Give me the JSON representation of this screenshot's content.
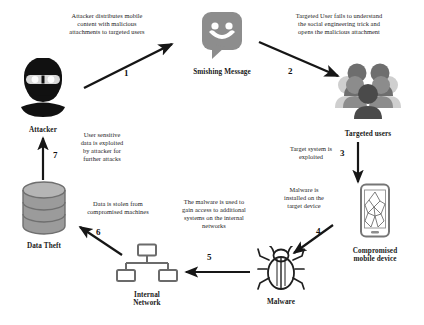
{
  "diagram": {
    "background_color": "#ffffff",
    "text_color": "#1c1c1c",
    "accent_gray": "#8a8a8a",
    "dark_gray": "#5f5f5f",
    "light_gray": "#c9c9c9",
    "arrow_color": "#1a1a1a"
  },
  "nodes": [
    {
      "id": "attacker",
      "label": "Attacker",
      "icon": "hooded-attacker-icon",
      "color": "#111111"
    },
    {
      "id": "smishing_message",
      "label": "Smishing Message",
      "icon": "chat-bubble-smiley-icon",
      "color": "#8a8a8a"
    },
    {
      "id": "targeted_users",
      "label": "Targeted users",
      "icon": "user-group-icon",
      "color": "#7d7d7d"
    },
    {
      "id": "compromised_device",
      "label": "Compromised\nmobile device",
      "label_line1": "Compromised",
      "label_line2": "mobile device",
      "icon": "cracked-smartphone-icon",
      "color": "#7a7a7a"
    },
    {
      "id": "malware",
      "label": "Malware",
      "icon": "bug-icon",
      "color": "#1f1f1f"
    },
    {
      "id": "internal_network",
      "label": "Internal\nNetwork",
      "label_line1": "Internal",
      "label_line2": "Network",
      "icon": "network-tree-icon",
      "color": "#6e6e6e"
    },
    {
      "id": "data_theft",
      "label": "Data Theft",
      "icon": "database-cylinder-icon",
      "color": "#8c8c8c"
    }
  ],
  "steps": [
    {
      "number": "1",
      "caption": "Attacker distributes mobile content with malicious attachments to targeted users",
      "caption_lines": [
        "Attacker distributes mobile",
        "content with malicious",
        "attachments to targeted users"
      ],
      "from": "attacker",
      "to": "smishing_message"
    },
    {
      "number": "2",
      "caption": "Targeted User fails to understand the social engineering trick and opens the malicious attachment",
      "caption_lines": [
        "Targeted User fails to understand",
        "the social engineering trick and",
        "opens the malicious attachment"
      ],
      "from": "smishing_message",
      "to": "targeted_users"
    },
    {
      "number": "3",
      "caption": "Target system is exploited",
      "caption_lines": [
        "Target system is",
        "exploited"
      ],
      "from": "targeted_users",
      "to": "compromised_device"
    },
    {
      "number": "4",
      "caption": "Malware is installed on the target device",
      "caption_lines": [
        "Malware is",
        "installed on the",
        "target device"
      ],
      "from": "compromised_device",
      "to": "malware"
    },
    {
      "number": "5",
      "caption": "The malware is used to gain access to additional systems on the internal networks",
      "caption_lines": [
        "The malware is used to",
        "gain access to additional",
        "systems on the internal",
        "networks"
      ],
      "from": "malware",
      "to": "internal_network"
    },
    {
      "number": "6",
      "caption": "Data is stolen from compromised machines",
      "caption_lines": [
        "Data is stolen from",
        "compromised machines"
      ],
      "from": "internal_network",
      "to": "data_theft"
    },
    {
      "number": "7",
      "caption": "User sensitive data is exploited by attacker for further attacks",
      "caption_lines": [
        "User sensitive",
        "data is exploited",
        "by attacker for",
        "further attacks"
      ],
      "from": "data_theft",
      "to": "attacker"
    }
  ]
}
